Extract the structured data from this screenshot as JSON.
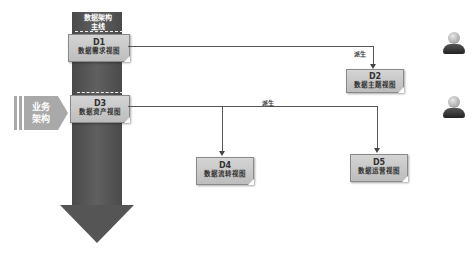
{
  "main_axis": {
    "label": "数据架构主线"
  },
  "business_arch": {
    "label_line1": "业务",
    "label_line2": "架构"
  },
  "nodes": [
    {
      "id": "D1",
      "code": "D1",
      "name": "数据需求视图"
    },
    {
      "id": "D2",
      "code": "D2",
      "name": "数据主题视图"
    },
    {
      "id": "D3",
      "code": "D3",
      "name": "数据资产视图"
    },
    {
      "id": "D4",
      "code": "D4",
      "name": "数据流转视图"
    },
    {
      "id": "D5",
      "code": "D5",
      "name": "数据运营视图"
    }
  ],
  "edges": [
    {
      "from": "D1",
      "to": "D2",
      "label": "派生"
    },
    {
      "from": "D3",
      "to": [
        "D4",
        "D5"
      ],
      "label": "派生"
    }
  ],
  "actors": [
    {
      "icon": "person-icon"
    },
    {
      "icon": "person-icon"
    }
  ],
  "colors": {
    "arrow": "#555555",
    "box": "#c8c8c8",
    "business": "#a9a9a9"
  }
}
